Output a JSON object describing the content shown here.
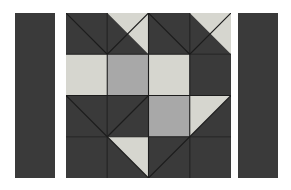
{
  "artwork": {
    "title": "Quilt Block Pattern",
    "kind": "patchwork-quilt-block",
    "background_color": "#ffffff",
    "palette": {
      "dark": "#3a3a3a",
      "medium": "#a8a8a8",
      "light": "#d6d6cf",
      "seam": "#1c1c1c"
    },
    "panels": [
      {
        "name": "left-sashing-strip",
        "label": "Left sashing strip",
        "fill": "dark"
      },
      {
        "name": "center-block",
        "label": "Center pieced block",
        "fill": "mixed"
      },
      {
        "name": "right-sashing-strip",
        "label": "Right sashing strip",
        "fill": "dark"
      }
    ]
  },
  "chart_data": {
    "type": "heatmap",
    "xlabel": "",
    "ylabel": "",
    "grid": true,
    "legend": "none",
    "rows": 4,
    "cols": 4,
    "cell_size": 41.25,
    "categories": [
      "col-1",
      "col-2",
      "col-3",
      "col-4"
    ],
    "row_labels": [
      "row-1",
      "row-2",
      "row-3",
      "row-4"
    ],
    "colors": {
      "dark": "#3a3a3a",
      "medium": "#a8a8a8",
      "light": "#d6d6cf"
    },
    "cells": [
      {
        "r": 0,
        "c": 0,
        "kind": "half-square-triangle",
        "base": "dark",
        "tri": "dark",
        "tri_corner": "none",
        "diagonal": "tl-br"
      },
      {
        "r": 0,
        "c": 1,
        "kind": "half-square-triangle",
        "base": "dark",
        "tri": "light",
        "tri_corner": "top-right",
        "diagonal": "bl-tr"
      },
      {
        "r": 0,
        "c": 2,
        "kind": "half-square-triangle",
        "base": "dark",
        "tri": "dark",
        "tri_corner": "none",
        "diagonal": "tl-br"
      },
      {
        "r": 0,
        "c": 3,
        "kind": "half-square-triangle",
        "base": "dark",
        "tri": "light",
        "tri_corner": "top-right",
        "diagonal": "bl-tr"
      },
      {
        "r": 1,
        "c": 0,
        "kind": "solid",
        "base": "light",
        "tri": "none",
        "tri_corner": "none",
        "diagonal": "none"
      },
      {
        "r": 1,
        "c": 1,
        "kind": "solid",
        "base": "medium",
        "tri": "none",
        "tri_corner": "none",
        "diagonal": "none"
      },
      {
        "r": 1,
        "c": 2,
        "kind": "solid",
        "base": "light",
        "tri": "none",
        "tri_corner": "none",
        "diagonal": "none"
      },
      {
        "r": 1,
        "c": 3,
        "kind": "solid",
        "base": "dark",
        "tri": "none",
        "tri_corner": "none",
        "diagonal": "none"
      },
      {
        "r": 2,
        "c": 0,
        "kind": "half-square-triangle",
        "base": "dark",
        "tri": "dark",
        "tri_corner": "none",
        "diagonal": "tl-br"
      },
      {
        "r": 2,
        "c": 1,
        "kind": "half-square-triangle",
        "base": "dark",
        "tri": "dark",
        "tri_corner": "none",
        "diagonal": "bl-tr"
      },
      {
        "r": 2,
        "c": 2,
        "kind": "solid",
        "base": "medium",
        "tri": "none",
        "tri_corner": "none",
        "diagonal": "none"
      },
      {
        "r": 2,
        "c": 3,
        "kind": "half-square-triangle",
        "base": "dark",
        "tri": "light",
        "tri_corner": "top-left",
        "diagonal": "tr-bl"
      },
      {
        "r": 3,
        "c": 0,
        "kind": "solid",
        "base": "dark",
        "tri": "none",
        "tri_corner": "none",
        "diagonal": "none"
      },
      {
        "r": 3,
        "c": 1,
        "kind": "half-square-triangle",
        "base": "dark",
        "tri": "light",
        "tri_corner": "top-right",
        "diagonal": "tl-br"
      },
      {
        "r": 3,
        "c": 2,
        "kind": "half-square-triangle",
        "base": "dark",
        "tri": "dark",
        "tri_corner": "none",
        "diagonal": "bl-tr"
      },
      {
        "r": 3,
        "c": 3,
        "kind": "solid",
        "base": "dark",
        "tri": "none",
        "tri_corner": "none",
        "diagonal": "none"
      }
    ]
  }
}
